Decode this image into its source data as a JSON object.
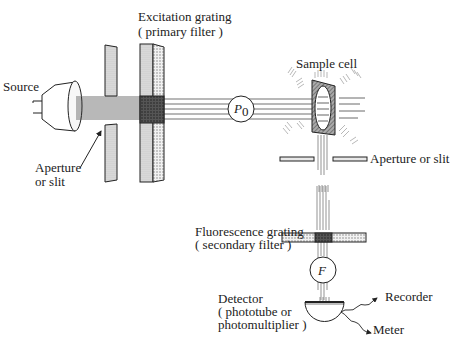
{
  "diagram": {
    "labels": {
      "source": "Source",
      "entrance_aperture": [
        "Aperture",
        "or slit"
      ],
      "excitation_grating": [
        "Excitation grating",
        "( primary filter )"
      ],
      "incident_power": "P",
      "incident_power_sub": "0",
      "sample_cell": "Sample cell",
      "exit_aperture": "Aperture or slit",
      "fluorescence_grating": [
        "Fluorescence grating",
        "( secondary filter )"
      ],
      "fluorescent_power": "F",
      "detector": [
        "Detector",
        "( phototube or",
        "photomultiplier )"
      ],
      "recorder": "Recorder",
      "meter": "Meter"
    },
    "colors": {
      "ink": "#222222",
      "plate_fill": "#d6d6d6",
      "dark_filter": "#4a4a4a",
      "background": "#ffffff"
    }
  }
}
